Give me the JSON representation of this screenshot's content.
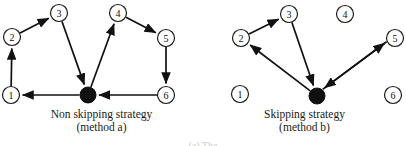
{
  "figure": {
    "background": "#ffffff",
    "stroke_color": "#111111",
    "hub_color": "#101010"
  },
  "diagrams": [
    {
      "id": "non-skipping",
      "caption_line1": "Non skipping strategy",
      "caption_line2": "(method a)",
      "hub": {
        "name": "hub",
        "cx": 88,
        "cy": 95,
        "r": 8
      },
      "nodes": [
        {
          "id": "n1",
          "label": "1",
          "cx": 11,
          "cy": 95,
          "r": 8.5
        },
        {
          "id": "n2",
          "label": "2",
          "cx": 12,
          "cy": 37,
          "r": 8.5
        },
        {
          "id": "n3",
          "label": "3",
          "cx": 59,
          "cy": 13,
          "r": 8.5
        },
        {
          "id": "n4",
          "label": "4",
          "cx": 118,
          "cy": 13,
          "r": 8.5
        },
        {
          "id": "n5",
          "label": "5",
          "cx": 166,
          "cy": 38,
          "r": 8.5
        },
        {
          "id": "n6",
          "label": "6",
          "cx": 166,
          "cy": 95,
          "r": 8.5
        }
      ],
      "edges": [
        {
          "from": "hub",
          "to": "n1",
          "label": "hub-to-1"
        },
        {
          "from": "n1",
          "to": "n2",
          "label": "1-to-2"
        },
        {
          "from": "n2",
          "to": "n3",
          "label": "2-to-3"
        },
        {
          "from": "n3",
          "to": "hub",
          "label": "3-to-hub"
        },
        {
          "from": "hub",
          "to": "n4",
          "label": "hub-to-4"
        },
        {
          "from": "n4",
          "to": "n5",
          "label": "4-to-5"
        },
        {
          "from": "n5",
          "to": "n6",
          "label": "5-to-6"
        },
        {
          "from": "n6",
          "to": "hub",
          "label": "6-to-hub"
        }
      ]
    },
    {
      "id": "skipping",
      "caption_line1": "Skipping strategy",
      "caption_line2": "(method b)",
      "hub": {
        "name": "hub",
        "cx": 317,
        "cy": 96,
        "r": 8
      },
      "nodes": [
        {
          "id": "n1",
          "label": "1",
          "cx": 240,
          "cy": 94,
          "r": 8.5
        },
        {
          "id": "n2",
          "label": "2",
          "cx": 241,
          "cy": 38,
          "r": 8.5
        },
        {
          "id": "n3",
          "label": "3",
          "cx": 289,
          "cy": 14,
          "r": 8.5
        },
        {
          "id": "n4",
          "label": "4",
          "cx": 345,
          "cy": 14,
          "r": 8.5
        },
        {
          "id": "n5",
          "label": "5",
          "cx": 395,
          "cy": 38,
          "r": 8.5
        },
        {
          "id": "n6",
          "label": "6",
          "cx": 393,
          "cy": 95,
          "r": 8.5
        }
      ],
      "edges": [
        {
          "from": "hub",
          "to": "n2",
          "label": "hub-to-2"
        },
        {
          "from": "n2",
          "to": "n3",
          "label": "2-to-3"
        },
        {
          "from": "n3",
          "to": "hub",
          "label": "3-to-hub"
        },
        {
          "from": "hub",
          "to": "n5",
          "label": "hub-to-5"
        },
        {
          "from": "n5",
          "to": "hub",
          "label": "5-to-hub"
        }
      ]
    }
  ],
  "footer": {
    "sliver_text": "(a) The"
  }
}
